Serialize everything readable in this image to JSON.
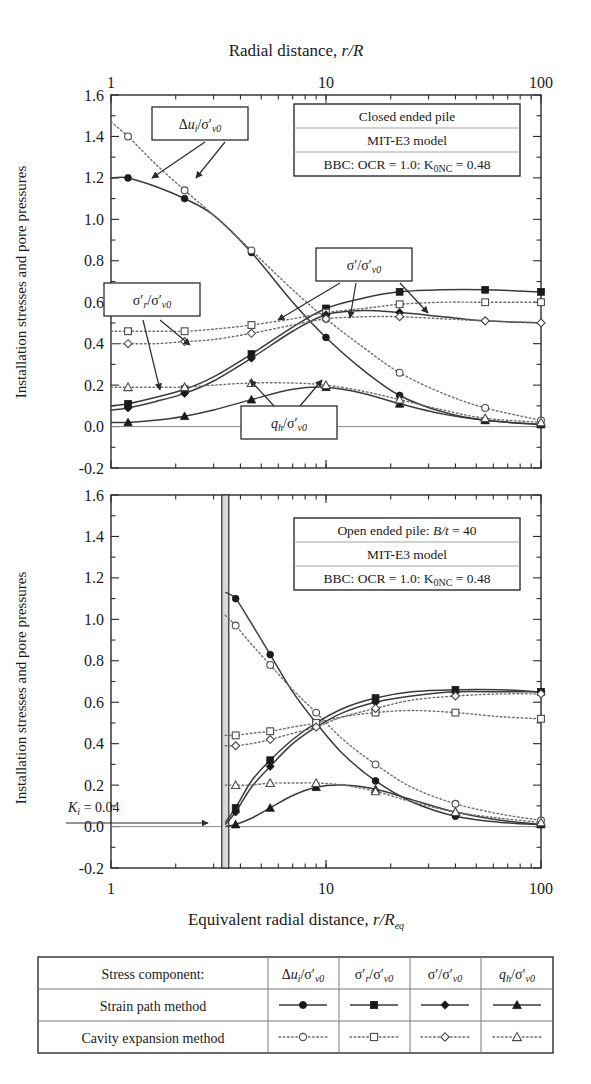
{
  "figure": {
    "top_axis_title": "Radial distance, r/R",
    "bottom_axis_title": "Equivalent radial distance, r/R",
    "bottom_axis_title_sub": "eq",
    "y_axis_title": "Installation stresses and pore pressures",
    "x_ticks": [
      "1",
      "10",
      "100"
    ],
    "y_ticks": [
      "1.6",
      "1.4",
      "1.2",
      "1.0",
      "0.8",
      "0.6",
      "0.4",
      "0.2",
      "0.0",
      "-0.2"
    ],
    "annotation_dui": "Δuᵢ/σ′ᵥ₀",
    "annotation_sigr": "σ′ᵣ/σ′ᵥ₀",
    "annotation_sig": "σ′/σ′ᵥ₀",
    "annotation_qh": "qₕ/σ′ᵥ₀",
    "ki_label": "K",
    "ki_sub": "i",
    "ki_value": " = 0.04",
    "panel1_info": [
      "Closed ended pile",
      "MIT-E3 model",
      "BBC: OCR = 1.0: K0NC = 0.48"
    ],
    "panel2_info": [
      "Open ended pile: B/t = 40",
      "MIT-E3 model",
      "BBC: OCR = 1.0: K0NC = 0.48"
    ]
  },
  "legend": {
    "row_header": "Stress component:",
    "rows": [
      "Strain path method",
      "Cavity expansion method"
    ],
    "columns": [
      "Δuᵢ/σ′ᵥ₀",
      "σ′ᵣ/σ′ᵥ₀",
      "σ′/σ′ᵥ₀",
      "qₕ/σ′ᵥ₀"
    ],
    "markers_filled": [
      "circle",
      "square",
      "diamond",
      "triangle"
    ],
    "markers_open": [
      "circle",
      "square",
      "diamond",
      "triangle"
    ]
  },
  "chart_data": [
    {
      "type": "line",
      "title": "Closed ended pile",
      "xlabel": "Radial distance, r/R",
      "ylabel": "Installation stresses and pore pressures",
      "xscale": "log",
      "xlim": [
        1,
        100
      ],
      "ylim": [
        -0.2,
        1.6
      ],
      "grid": false,
      "series": [
        {
          "name": "Δu_i/σ'_v0 strain path method",
          "style": "solid",
          "marker": "circle-filled",
          "x": [
            1.0,
            1.2,
            1.6,
            2.2,
            3.0,
            4.5,
            7.0,
            10.0,
            15.0,
            22.0,
            35.0,
            55.0,
            100.0
          ],
          "y": [
            1.2,
            1.2,
            1.16,
            1.1,
            1.02,
            0.84,
            0.6,
            0.43,
            0.27,
            0.15,
            0.07,
            0.03,
            0.01
          ]
        },
        {
          "name": "Δu_i/σ'_v0 cavity expansion method",
          "style": "dotted",
          "marker": "circle-open",
          "x": [
            1.0,
            1.2,
            1.6,
            2.2,
            3.0,
            4.5,
            7.0,
            10.0,
            15.0,
            22.0,
            35.0,
            55.0,
            100.0
          ],
          "y": [
            1.47,
            1.4,
            1.27,
            1.14,
            1.02,
            0.85,
            0.66,
            0.52,
            0.38,
            0.26,
            0.16,
            0.09,
            0.03
          ]
        },
        {
          "name": "σ'_r/σ'_v0 strain path method",
          "style": "solid",
          "marker": "square-filled",
          "x": [
            1.0,
            1.2,
            1.6,
            2.2,
            3.0,
            4.5,
            7.0,
            10.0,
            15.0,
            22.0,
            35.0,
            55.0,
            100.0
          ],
          "y": [
            0.1,
            0.11,
            0.14,
            0.18,
            0.24,
            0.35,
            0.48,
            0.57,
            0.62,
            0.65,
            0.66,
            0.66,
            0.65
          ]
        },
        {
          "name": "σ'_r/σ'_v0 cavity expansion method",
          "style": "dotted",
          "marker": "square-open",
          "x": [
            1.0,
            1.2,
            1.6,
            2.2,
            3.0,
            4.5,
            7.0,
            10.0,
            15.0,
            22.0,
            35.0,
            55.0,
            100.0
          ],
          "y": [
            0.46,
            0.46,
            0.46,
            0.46,
            0.47,
            0.49,
            0.52,
            0.55,
            0.57,
            0.59,
            0.6,
            0.6,
            0.6
          ]
        },
        {
          "name": "σ'/σ'_v0 strain path method",
          "style": "solid",
          "marker": "diamond-filled",
          "x": [
            1.0,
            1.2,
            1.6,
            2.2,
            3.0,
            4.5,
            7.0,
            10.0,
            15.0,
            22.0,
            35.0,
            55.0,
            100.0
          ],
          "y": [
            0.08,
            0.09,
            0.12,
            0.16,
            0.22,
            0.33,
            0.46,
            0.54,
            0.56,
            0.55,
            0.53,
            0.51,
            0.5
          ]
        },
        {
          "name": "σ'/σ'_v0 cavity expansion method",
          "style": "dotted",
          "marker": "diamond-open",
          "x": [
            1.0,
            1.2,
            1.6,
            2.2,
            3.0,
            4.5,
            7.0,
            10.0,
            15.0,
            22.0,
            35.0,
            55.0,
            100.0
          ],
          "y": [
            0.4,
            0.4,
            0.4,
            0.41,
            0.42,
            0.45,
            0.49,
            0.52,
            0.53,
            0.53,
            0.52,
            0.51,
            0.5
          ]
        },
        {
          "name": "q_h/σ'_v0 strain path method",
          "style": "solid",
          "marker": "triangle-filled",
          "x": [
            1.0,
            1.2,
            1.6,
            2.2,
            3.0,
            4.5,
            7.0,
            10.0,
            15.0,
            22.0,
            35.0,
            55.0,
            100.0
          ],
          "y": [
            0.02,
            0.02,
            0.03,
            0.05,
            0.08,
            0.13,
            0.18,
            0.19,
            0.16,
            0.11,
            0.06,
            0.03,
            0.01
          ]
        },
        {
          "name": "q_h/σ'_v0 cavity expansion method",
          "style": "dotted",
          "marker": "triangle-open",
          "x": [
            1.0,
            1.2,
            1.6,
            2.2,
            3.0,
            4.5,
            7.0,
            10.0,
            15.0,
            22.0,
            35.0,
            55.0,
            100.0
          ],
          "y": [
            0.19,
            0.19,
            0.19,
            0.19,
            0.2,
            0.21,
            0.21,
            0.2,
            0.17,
            0.13,
            0.08,
            0.04,
            0.02
          ]
        }
      ]
    },
    {
      "type": "line",
      "title": "Open ended pile: B/t = 40",
      "xlabel": "Equivalent radial distance, r/R_eq",
      "ylabel": "Installation stresses and pore pressures",
      "xscale": "log",
      "xlim": [
        1,
        100
      ],
      "ylim": [
        -0.2,
        1.6
      ],
      "grid": false,
      "pile_wall_x": 3.4,
      "annotations": [
        {
          "text": "K_i = 0.04",
          "x": 1.9,
          "y": 0.08
        }
      ],
      "series": [
        {
          "name": "Δu_i/σ'_v0 strain path method",
          "style": "solid",
          "marker": "circle-filled",
          "x": [
            3.4,
            3.8,
            4.5,
            5.5,
            7.0,
            9.0,
            12.0,
            17.0,
            25.0,
            40.0,
            65.0,
            100.0
          ],
          "y": [
            1.13,
            1.1,
            0.98,
            0.83,
            0.65,
            0.5,
            0.35,
            0.22,
            0.12,
            0.05,
            0.02,
            0.01
          ]
        },
        {
          "name": "Δu_i/σ'_v0 cavity expansion method",
          "style": "dotted",
          "marker": "circle-open",
          "x": [
            3.4,
            3.8,
            4.5,
            5.5,
            7.0,
            9.0,
            12.0,
            17.0,
            25.0,
            40.0,
            65.0,
            100.0
          ],
          "y": [
            1.02,
            0.97,
            0.88,
            0.78,
            0.66,
            0.55,
            0.42,
            0.3,
            0.19,
            0.11,
            0.06,
            0.03
          ]
        },
        {
          "name": "σ'_r/σ'_v0 strain path method",
          "style": "solid",
          "marker": "square-filled",
          "x": [
            3.4,
            3.8,
            4.5,
            5.5,
            7.0,
            9.0,
            12.0,
            17.0,
            25.0,
            40.0,
            65.0,
            100.0
          ],
          "y": [
            0.02,
            0.09,
            0.22,
            0.32,
            0.42,
            0.5,
            0.57,
            0.62,
            0.65,
            0.66,
            0.66,
            0.65
          ]
        },
        {
          "name": "σ'_r/σ'_v0 cavity expansion method",
          "style": "dotted",
          "marker": "square-open",
          "x": [
            3.4,
            3.8,
            4.5,
            5.5,
            7.0,
            9.0,
            12.0,
            17.0,
            25.0,
            40.0,
            65.0,
            100.0
          ],
          "y": [
            0.44,
            0.44,
            0.45,
            0.46,
            0.48,
            0.5,
            0.53,
            0.55,
            0.56,
            0.55,
            0.53,
            0.52
          ]
        },
        {
          "name": "σ'/σ'_v0 strain path method",
          "style": "solid",
          "marker": "diamond-filled",
          "x": [
            3.4,
            3.8,
            4.5,
            5.5,
            7.0,
            9.0,
            12.0,
            17.0,
            25.0,
            40.0,
            65.0,
            100.0
          ],
          "y": [
            0.01,
            0.07,
            0.19,
            0.29,
            0.4,
            0.48,
            0.55,
            0.6,
            0.63,
            0.65,
            0.65,
            0.65
          ]
        },
        {
          "name": "σ'/σ'_v0 cavity expansion method",
          "style": "dotted",
          "marker": "diamond-open",
          "x": [
            3.4,
            3.8,
            4.5,
            5.5,
            7.0,
            9.0,
            12.0,
            17.0,
            25.0,
            40.0,
            65.0,
            100.0
          ],
          "y": [
            0.39,
            0.39,
            0.4,
            0.42,
            0.45,
            0.48,
            0.53,
            0.57,
            0.61,
            0.63,
            0.64,
            0.64
          ]
        },
        {
          "name": "q_h/σ'_v0 strain path method",
          "style": "solid",
          "marker": "triangle-filled",
          "x": [
            3.4,
            3.8,
            4.5,
            5.5,
            7.0,
            9.0,
            12.0,
            17.0,
            25.0,
            40.0,
            65.0,
            100.0
          ],
          "y": [
            0.0,
            0.01,
            0.04,
            0.09,
            0.15,
            0.19,
            0.2,
            0.18,
            0.13,
            0.07,
            0.03,
            0.01
          ]
        },
        {
          "name": "q_h/σ'_v0 cavity expansion method",
          "style": "dotted",
          "marker": "triangle-open",
          "x": [
            3.4,
            3.8,
            4.5,
            5.5,
            7.0,
            9.0,
            12.0,
            17.0,
            25.0,
            40.0,
            65.0,
            100.0
          ],
          "y": [
            0.2,
            0.2,
            0.2,
            0.21,
            0.21,
            0.21,
            0.2,
            0.17,
            0.12,
            0.07,
            0.04,
            0.02
          ]
        }
      ]
    }
  ]
}
